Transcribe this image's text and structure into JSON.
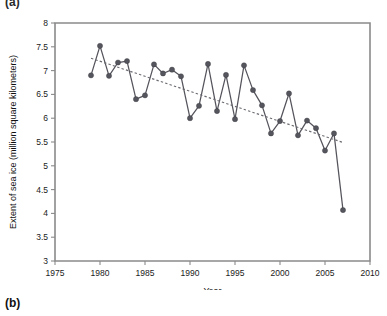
{
  "figure": {
    "panel_label_a": "(a)",
    "panel_label_b": "(b)"
  },
  "chart_data": {
    "type": "line",
    "title": "",
    "subtitle": "",
    "xlabel": "Year",
    "ylabel": "Extent of sea ice (million square kilometers)",
    "xlim": [
      1975,
      2010
    ],
    "ylim": [
      3,
      8
    ],
    "xticks": [
      1975,
      1980,
      1985,
      1990,
      1995,
      2000,
      2005,
      2010
    ],
    "yticks": [
      3,
      3.5,
      4,
      4.5,
      5,
      5.5,
      6,
      6.5,
      7,
      7.5,
      8
    ],
    "xtick_labels": [
      "1975",
      "1980",
      "1985",
      "1990",
      "1995",
      "2000",
      "2005",
      "2010"
    ],
    "ytick_labels": [
      "3",
      "3.5",
      "4",
      "4.5",
      "5",
      "5.5",
      "6",
      "6.5",
      "7",
      "7.5",
      "8"
    ],
    "grid": false,
    "legend": "none",
    "series": [
      {
        "name": "Extent of sea ice",
        "marker": "filled-circle",
        "color": "#55555d",
        "x": [
          1979,
          1980,
          1981,
          1982,
          1983,
          1984,
          1985,
          1986,
          1987,
          1988,
          1989,
          1990,
          1991,
          1992,
          1993,
          1994,
          1995,
          1996,
          1997,
          1998,
          1999,
          2000,
          2001,
          2002,
          2003,
          2004,
          2005,
          2006,
          2007
        ],
        "values": [
          6.9,
          7.52,
          6.89,
          7.17,
          7.2,
          6.4,
          6.48,
          7.13,
          6.94,
          7.02,
          6.88,
          6.0,
          6.26,
          7.14,
          6.15,
          6.91,
          5.98,
          7.11,
          6.59,
          6.27,
          5.68,
          5.94,
          6.52,
          5.64,
          5.95,
          5.79,
          5.32,
          5.68,
          4.07
        ]
      }
    ],
    "trend": {
      "name": "linear trend",
      "style": "dashed",
      "color": "#6b6b72",
      "x": [
        1979,
        2007
      ],
      "values": [
        7.26,
        5.49
      ]
    },
    "annotations": []
  }
}
